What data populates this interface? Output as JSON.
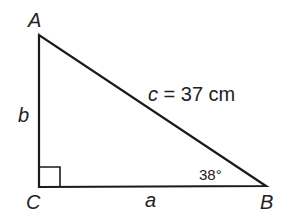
{
  "diagram": {
    "type": "right-triangle",
    "vertices": {
      "A": "A",
      "B": "B",
      "C": "C"
    },
    "sides": {
      "a": "a",
      "b": "b"
    },
    "hypotenuse": {
      "var": "c",
      "eq": "=",
      "value": "37 cm"
    },
    "angle_B": "38°",
    "colors": {
      "stroke": "#1a1a1a",
      "text": "#222222"
    }
  }
}
